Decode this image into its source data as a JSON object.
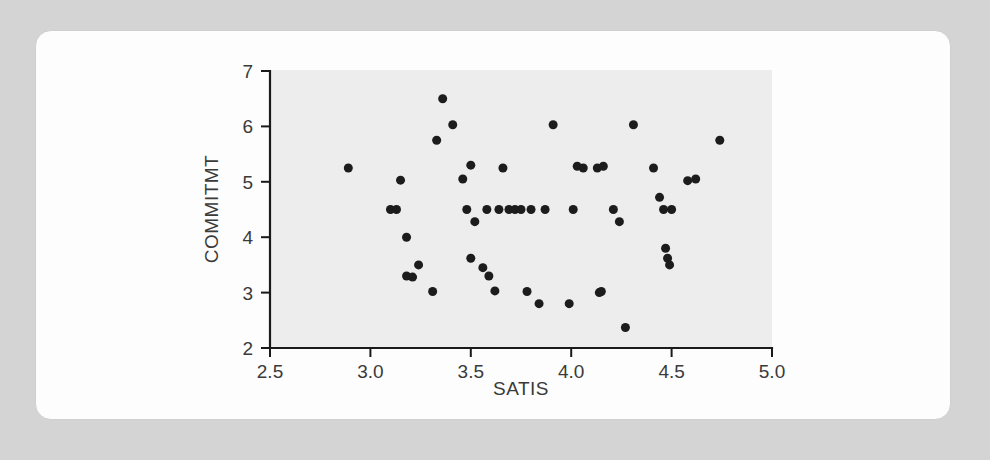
{
  "page": {
    "background_color": "#d4d4d4",
    "card_color": "#fdfdfd"
  },
  "chart_data": {
    "type": "scatter",
    "title": "",
    "subtitle": "",
    "xlabel": "SATIS",
    "ylabel": "COMMITMT",
    "xlim": [
      2.5,
      5.0
    ],
    "ylim": [
      2,
      7
    ],
    "xticks": [
      2.5,
      3.0,
      3.5,
      4.0,
      4.5,
      5.0
    ],
    "xtick_labels": [
      "2.5",
      "3.0",
      "3.5",
      "4.0",
      "4.5",
      "5.0"
    ],
    "yticks": [
      2,
      3,
      4,
      5,
      6,
      7
    ],
    "ytick_labels": [
      "2",
      "3",
      "4",
      "5",
      "6",
      "7"
    ],
    "grid": false,
    "legend": false,
    "marker": "circle",
    "marker_color": "#1c1c1c",
    "marker_size": 7,
    "panel_color": "#ededed",
    "x": [
      2.89,
      3.1,
      3.13,
      3.15,
      3.18,
      3.18,
      3.21,
      3.24,
      3.31,
      3.33,
      3.36,
      3.41,
      3.46,
      3.48,
      3.5,
      3.5,
      3.52,
      3.56,
      3.58,
      3.59,
      3.62,
      3.64,
      3.66,
      3.69,
      3.72,
      3.75,
      3.78,
      3.8,
      3.84,
      3.87,
      3.91,
      3.99,
      4.01,
      4.03,
      4.06,
      4.13,
      4.14,
      4.15,
      4.16,
      4.21,
      4.24,
      4.27,
      4.31,
      4.41,
      4.44,
      4.46,
      4.47,
      4.48,
      4.49,
      4.5,
      4.58,
      4.62,
      4.74
    ],
    "y": [
      5.25,
      4.5,
      4.5,
      5.03,
      4.0,
      3.3,
      3.28,
      3.5,
      3.02,
      5.75,
      6.5,
      6.03,
      5.05,
      4.5,
      3.62,
      5.3,
      4.28,
      3.45,
      4.5,
      3.3,
      3.03,
      4.5,
      5.25,
      4.5,
      4.5,
      4.5,
      3.02,
      4.5,
      2.8,
      4.5,
      6.03,
      2.8,
      4.5,
      5.28,
      5.25,
      5.25,
      3.0,
      3.02,
      5.28,
      4.5,
      4.28,
      2.37,
      6.03,
      5.25,
      4.72,
      4.5,
      3.8,
      3.62,
      3.5,
      4.5,
      5.02,
      5.05,
      5.75
    ]
  },
  "axes": {
    "x_title": "SATIS",
    "y_title": "COMMITMT"
  }
}
